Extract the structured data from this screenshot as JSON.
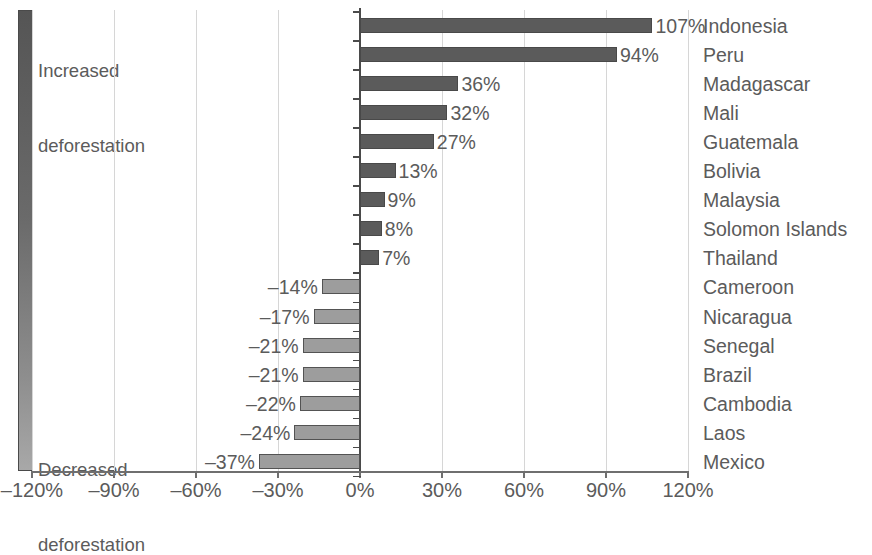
{
  "legend": {
    "increased_line1": "Increased",
    "increased_line2": "deforestation",
    "decreased_line1": "Decreased",
    "decreased_line2": "deforestation",
    "gradient_top_color": "#555555",
    "gradient_bottom_color": "#a8a8a8"
  },
  "colors": {
    "positive_bar": "#5b5b5b",
    "negative_bar": "#9d9d9d",
    "bar_outline": "#4a4a4a",
    "gridline": "#d6d6d6",
    "axis": "#6f6f6f",
    "text": "#5b5b5b"
  },
  "chart_data": {
    "type": "bar",
    "orientation": "horizontal",
    "title": "",
    "subtitle": "",
    "xlabel": "",
    "ylabel": "",
    "xlim": [
      -120,
      120
    ],
    "xticks": [
      -120,
      -90,
      -60,
      -30,
      0,
      30,
      60,
      90,
      120
    ],
    "xtick_labels": [
      "–120%",
      "–90%",
      "–60%",
      "–30%",
      "0%",
      "30%",
      "60%",
      "90%",
      "120%"
    ],
    "grid": true,
    "legend_position": "left",
    "legend_entries": [
      "Increased deforestation",
      "Decreased deforestation"
    ],
    "categories": [
      "Indonesia",
      "Peru",
      "Madagascar",
      "Mali",
      "Guatemala",
      "Bolivia",
      "Malaysia",
      "Solomon Islands",
      "Thailand",
      "Cameroon",
      "Nicaragua",
      "Senegal",
      "Brazil",
      "Cambodia",
      "Laos",
      "Mexico"
    ],
    "values": [
      107,
      94,
      36,
      32,
      27,
      13,
      9,
      8,
      7,
      -14,
      -17,
      -21,
      -21,
      -22,
      -24,
      -37
    ],
    "value_labels": [
      "107%",
      "94%",
      "36%",
      "32%",
      "27%",
      "13%",
      "9%",
      "8%",
      "7%",
      "–14%",
      "–17%",
      "–21%",
      "–21%",
      "–22%",
      "–24%",
      "–37%"
    ]
  }
}
